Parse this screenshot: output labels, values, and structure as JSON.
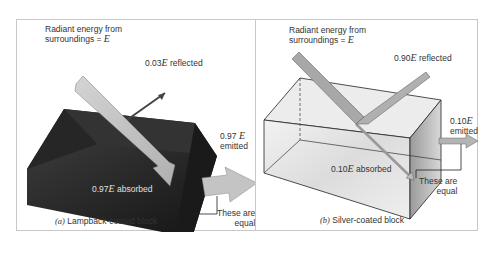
{
  "figure": {
    "panels": [
      {
        "id": "a",
        "block": "lampblack",
        "incident_label_line1": "Radiant energy from",
        "incident_label_line2": "surroundings = ",
        "incident_symbol": "E",
        "reflected_coef": "0.03",
        "reflected_symbol": "E",
        "reflected_text": " reflected",
        "emitted_coef": "0.97",
        "emitted_symbol": "E",
        "emitted_text": "emitted",
        "absorbed_coef": "0.97",
        "absorbed_symbol": "E",
        "absorbed_text": " absorbed",
        "equal_line1": "These are",
        "equal_line2": "equal",
        "caption_letter": "(a)",
        "caption_text": " Lampback-coated block",
        "block_color": "#1e1e1e",
        "arrow_color": "#c8c8c8"
      },
      {
        "id": "b",
        "block": "silver",
        "incident_label_line1": "Radiant energy from",
        "incident_label_line2": "surroundings = ",
        "incident_symbol": "E",
        "reflected_coef": "0.90",
        "reflected_symbol": "E",
        "reflected_text": " reflected",
        "emitted_coef": "0.10",
        "emitted_symbol": "E",
        "emitted_text": "emitted",
        "absorbed_coef": "0.10",
        "absorbed_symbol": "E",
        "absorbed_text": " absorbed",
        "equal_line1": "These are",
        "equal_line2": "equal",
        "caption_letter": "(b)",
        "caption_text": " Silver-coated block",
        "block_color": "#e6e6e6",
        "arrow_color": "#a8a8a8"
      }
    ]
  }
}
